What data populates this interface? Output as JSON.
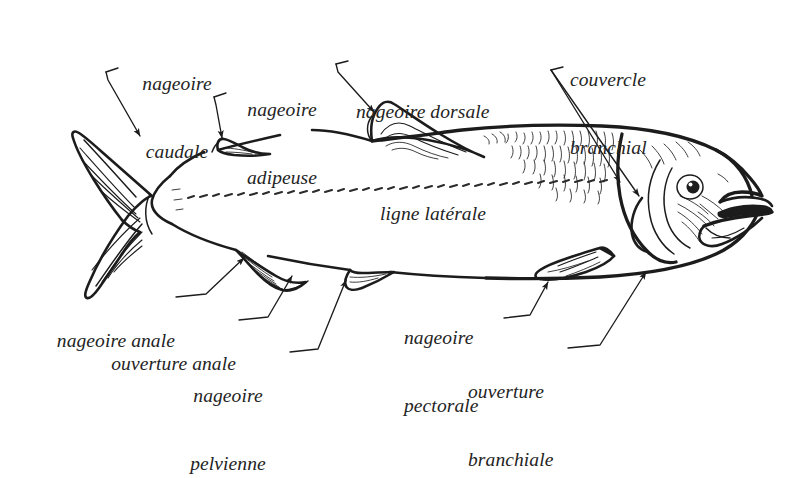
{
  "figure": {
    "background_color": "#ffffff",
    "ink_color": "#1c1c1c",
    "text_color": "#242424",
    "width": 810,
    "height": 418
  },
  "labels": {
    "caudal_fin": {
      "line1": "nageoire",
      "line2": "caudale"
    },
    "adipose_fin": {
      "line1": "nageoire",
      "line2": "adipeuse"
    },
    "dorsal_fin": {
      "line1": "nageoire dorsale"
    },
    "gill_cover": {
      "line1": "couvercle",
      "line2": "branchial"
    },
    "lateral_line": {
      "line1": "ligne latérale"
    },
    "anal_fin": {
      "line1": "nageoire anale"
    },
    "anal_opening": {
      "line1": "ouverture anale"
    },
    "pelvic_fin": {
      "line1": "nageoire",
      "line2": "pelvienne"
    },
    "pectoral_fin": {
      "line1": "nageoire",
      "line2": "pectorale"
    },
    "gill_opening": {
      "line1": "ouverture",
      "line2": "branchiale"
    }
  },
  "parts": [
    {
      "id": "caudal-fin",
      "name": "nageoire caudale",
      "english": "caudal fin"
    },
    {
      "id": "adipose-fin",
      "name": "nageoire adipeuse",
      "english": "adipose fin"
    },
    {
      "id": "dorsal-fin",
      "name": "nageoire dorsale",
      "english": "dorsal fin"
    },
    {
      "id": "gill-cover",
      "name": "couvercle branchial",
      "english": "operculum"
    },
    {
      "id": "lateral-line",
      "name": "ligne latérale",
      "english": "lateral line"
    },
    {
      "id": "anal-fin",
      "name": "nageoire anale",
      "english": "anal fin"
    },
    {
      "id": "anal-opening",
      "name": "ouverture anale",
      "english": "anal opening"
    },
    {
      "id": "pelvic-fin",
      "name": "nageoire pelvienne",
      "english": "pelvic fin"
    },
    {
      "id": "pectoral-fin",
      "name": "nageoire pectorale",
      "english": "pectoral fin"
    },
    {
      "id": "gill-opening",
      "name": "ouverture branchiale",
      "english": "gill opening"
    }
  ]
}
